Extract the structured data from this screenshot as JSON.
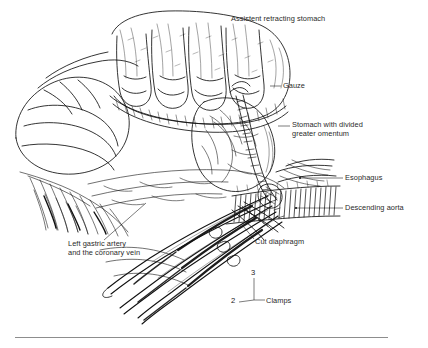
{
  "figure": {
    "domain": "line-drawing",
    "background_color": "#ffffff",
    "ink_color": "#111111",
    "label_color": "#2a2a2a",
    "rule_color": "#8d8d8d",
    "width": 428,
    "height": 348
  },
  "labels": [
    {
      "id": "assistent-retracting-stomach",
      "text": "Assistent retracting stomach",
      "x": 231,
      "y": 14,
      "leader": false
    },
    {
      "id": "gauze",
      "text": "Gauze",
      "x": 283,
      "y": 86,
      "leader": true
    },
    {
      "id": "stomach-with-divided-greater-omentum",
      "text": "Stomach with divided\ngreater omentum",
      "x": 292,
      "y": 122,
      "leader": true
    },
    {
      "id": "esophagus",
      "text": "Esophagus",
      "x": 345,
      "y": 175,
      "leader": true
    },
    {
      "id": "descending-aorta",
      "text": "Descending aorta",
      "x": 345,
      "y": 205,
      "leader": true
    },
    {
      "id": "cut-diaphragm",
      "text": "Cut diaphragm",
      "x": 255,
      "y": 241,
      "leader": true
    },
    {
      "id": "left-gastric-artery-and-the-coronary-vein",
      "text": "Left gastric artery\nand the coronary vein",
      "x": 68,
      "y": 243,
      "leader": true
    },
    {
      "id": "clamps",
      "text": "Clamps",
      "x": 256,
      "y": 300,
      "leader": true
    }
  ],
  "callout_numbers": [
    {
      "id": "clamp-number-3",
      "text": "3",
      "x": 252,
      "y": 272
    },
    {
      "id": "clamp-number-2",
      "text": "2",
      "x": 231,
      "y": 300
    }
  ],
  "structures": [
    "gloved assistant hand with four fingers retracting stomach",
    "stomach body with divided greater omentum",
    "gauze strip packing",
    "esophagus",
    "descending aorta with vertical hatching",
    "cut diaphragm edge",
    "left gastric artery and coronary vein",
    "three long surgical clamps"
  ]
}
